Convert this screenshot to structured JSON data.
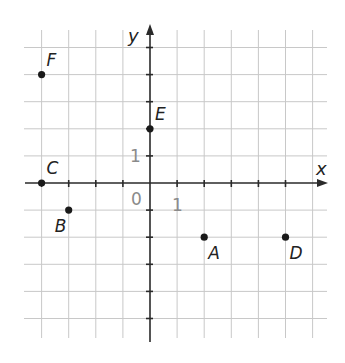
{
  "diagram": {
    "type": "coordinate-grid",
    "axes": {
      "x_label": "x",
      "y_label": "y",
      "x_range": [
        -4,
        6
      ],
      "y_range": [
        -5,
        5
      ],
      "origin_label": "0",
      "x_unit_label": "1",
      "y_unit_label": "1"
    },
    "points": [
      {
        "name": "A",
        "x": 2,
        "y": -2,
        "label_pos": "below-right"
      },
      {
        "name": "B",
        "x": -3,
        "y": -1,
        "label_pos": "below-left"
      },
      {
        "name": "C",
        "x": -4,
        "y": 0,
        "label_pos": "above-right"
      },
      {
        "name": "D",
        "x": 5,
        "y": -2,
        "label_pos": "below-right"
      },
      {
        "name": "E",
        "x": 0,
        "y": 2,
        "label_pos": "above-right"
      },
      {
        "name": "F",
        "x": -4,
        "y": 4,
        "label_pos": "above-right"
      }
    ],
    "colors": {
      "grid": "#c8c8c8",
      "axis": "#2a2a2a",
      "point": "#1a1a1a",
      "number_labels": "#8a8a8a"
    }
  }
}
